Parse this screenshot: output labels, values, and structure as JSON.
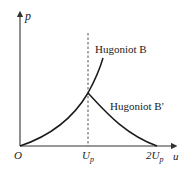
{
  "diagram": {
    "axes": {
      "y_label": "p",
      "x_label": "u",
      "origin_label": "O"
    },
    "ticks": {
      "up": "U",
      "up_sub": "p",
      "two_up": "2U",
      "two_up_sub": "p"
    },
    "curves": [
      {
        "name": "Hugoniot B",
        "label": "Hugoniot B"
      },
      {
        "name": "Hugoniot B'",
        "label": "Hugoniot B'"
      }
    ],
    "colors": {
      "line": "#1a1a1a",
      "axis": "#333333",
      "dashed": "#555555"
    }
  }
}
